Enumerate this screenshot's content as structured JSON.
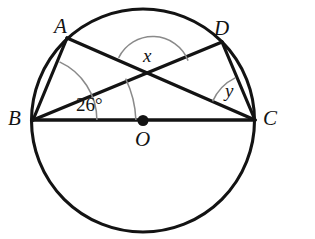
{
  "figure": {
    "type": "circle-geometry-diagram",
    "background_color": "#ffffff",
    "stroke_color": "#131313",
    "arc_color": "#8a8a8a",
    "canvas": {
      "width": 315,
      "height": 239
    }
  },
  "circle": {
    "center_label": "O",
    "center": {
      "x": 143,
      "y": 120.5
    },
    "radius": 111.5,
    "center_dot_radius": 5.5
  },
  "points": [
    {
      "label": "A",
      "x": 67,
      "y": 38
    },
    {
      "label": "D",
      "x": 222,
      "y": 42
    },
    {
      "label": "B",
      "x": 33,
      "y": 120
    },
    {
      "label": "C",
      "x": 255,
      "y": 120
    },
    {
      "label": "O",
      "x": 143,
      "y": 120.5
    }
  ],
  "segments": [
    {
      "name": "BC",
      "from": "B",
      "to": "C",
      "note": "diameter through O"
    },
    {
      "name": "AB",
      "from": "A",
      "to": "B"
    },
    {
      "name": "AC",
      "from": "A",
      "to": "C"
    },
    {
      "name": "BD",
      "from": "B",
      "to": "D"
    },
    {
      "name": "DC",
      "from": "D",
      "to": "C"
    }
  ],
  "intersection": {
    "name": "AC-BD-intersection",
    "x": 152,
    "y": 73
  },
  "angles": [
    {
      "id": "angle-x",
      "label": "x",
      "vertex": "intersection of AC and BD",
      "description": "angle between AC and BD opening upward"
    },
    {
      "id": "angle-y",
      "label": "y",
      "vertex": "C",
      "description": "angle ACD between CA and CD"
    },
    {
      "id": "angle-26",
      "label": "26°",
      "vertex": "B",
      "description": "angle DBC between BD and BC"
    },
    {
      "id": "angle-ABC",
      "label": "",
      "vertex": "B",
      "description": "unlabelled arc marking angle ABC between BA and BC"
    }
  ],
  "labels": {
    "A": "A",
    "D": "D",
    "B": "B",
    "C": "C",
    "O": "O",
    "x": "x",
    "y": "y",
    "angle_measure": "26°"
  }
}
